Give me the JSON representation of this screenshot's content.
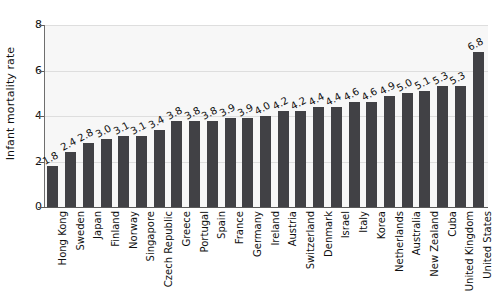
{
  "chart_data": {
    "type": "bar",
    "title": "",
    "subtitle": "",
    "xlabel": "",
    "ylabel": "Infant mortality rate",
    "ylim": [
      0,
      8
    ],
    "yticks": [
      0,
      2,
      4,
      6,
      8
    ],
    "grid": true,
    "legend": "none",
    "orientation": "vertical",
    "value_labels": true,
    "categories": [
      "Hong Kong",
      "Sweden",
      "Japan",
      "Finland",
      "Norway",
      "Singapore",
      "Czech Republic",
      "Greece",
      "Portugal",
      "Spain",
      "France",
      "Germany",
      "Ireland",
      "Austria",
      "Switzerland",
      "Denmark",
      "Israel",
      "Italy",
      "Korea",
      "Netherlands",
      "Australia",
      "New Zealand",
      "Cuba",
      "United Kingdom",
      "United States"
    ],
    "values": [
      1.8,
      2.4,
      2.8,
      3.0,
      3.1,
      3.1,
      3.4,
      3.8,
      3.8,
      3.8,
      3.9,
      3.9,
      4.0,
      4.2,
      4.2,
      4.4,
      4.4,
      4.6,
      4.6,
      4.9,
      5.0,
      5.1,
      5.3,
      5.3,
      6.8
    ],
    "value_label_text": [
      "1.8",
      "2.4",
      "2.8",
      "3.0",
      "3.1",
      "3.1",
      "3.4",
      "3.8",
      "3.8",
      "3.8",
      "3.9",
      "3.9",
      "4.0",
      "4.2",
      "4.2",
      "4.4",
      "4.4",
      "4.6",
      "4.6",
      "4.9",
      "5.0",
      "5.1",
      "5.3",
      "5.3",
      "6.8"
    ],
    "ytick_labels": [
      "0",
      "2",
      "4",
      "6",
      "8"
    ],
    "colors": {
      "bar": "#414145",
      "plot_background": "#f7f7f7",
      "gridline": "#dedede",
      "axis": "#5a5a5a",
      "text": "#101010",
      "page_background": "#ffffff"
    }
  }
}
